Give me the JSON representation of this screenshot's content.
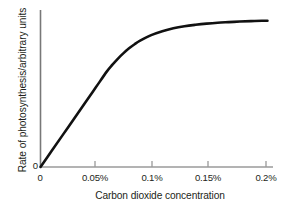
{
  "chart_data": {
    "type": "line",
    "title": "",
    "xlabel": "Carbon dioxide concentration",
    "ylabel": "Rate of photosynthesis/arbitrary units",
    "xlim": [
      0,
      0.21
    ],
    "ylim": [
      0,
      1.05
    ],
    "grid": false,
    "legend": null,
    "x_tick_labels": [
      "0",
      "0.05%",
      "0.1%",
      "0.15%",
      "0.2%"
    ],
    "x_tick_values": [
      0,
      0.05,
      0.1,
      0.15,
      0.2
    ],
    "y_tick_labels": [
      "0"
    ],
    "y_tick_values": [
      0
    ],
    "series": [
      {
        "name": "Rate of photosynthesis",
        "color": "#111111",
        "x": [
          0,
          0.01,
          0.02,
          0.03,
          0.04,
          0.05,
          0.06,
          0.065,
          0.07,
          0.075,
          0.08,
          0.085,
          0.09,
          0.1,
          0.11,
          0.12,
          0.13,
          0.14,
          0.15,
          0.16,
          0.17,
          0.18,
          0.19,
          0.2,
          0.205
        ],
        "y": [
          0,
          0.109,
          0.218,
          0.327,
          0.436,
          0.545,
          0.654,
          0.7,
          0.742,
          0.779,
          0.812,
          0.84,
          0.864,
          0.902,
          0.929,
          0.949,
          0.963,
          0.973,
          0.981,
          0.987,
          0.991,
          0.995,
          0.998,
          1.0,
          1.0
        ]
      }
    ],
    "axis_color": "#6f6f6f",
    "curve_color": "#111111",
    "background_color": "#ffffff"
  },
  "axes": {
    "x_title": "Carbon dioxide concentration",
    "y_title": "Rate of photosynthesis/arbitrary units",
    "y_origin_label": "0",
    "x_ticks": [
      {
        "label": "0",
        "left": 32
      },
      {
        "label": "0.05%",
        "left": 73
      },
      {
        "label": "0.1%",
        "left": 130
      },
      {
        "label": "0.15%",
        "left": 186
      },
      {
        "label": "0.2%",
        "left": 244
      }
    ]
  }
}
